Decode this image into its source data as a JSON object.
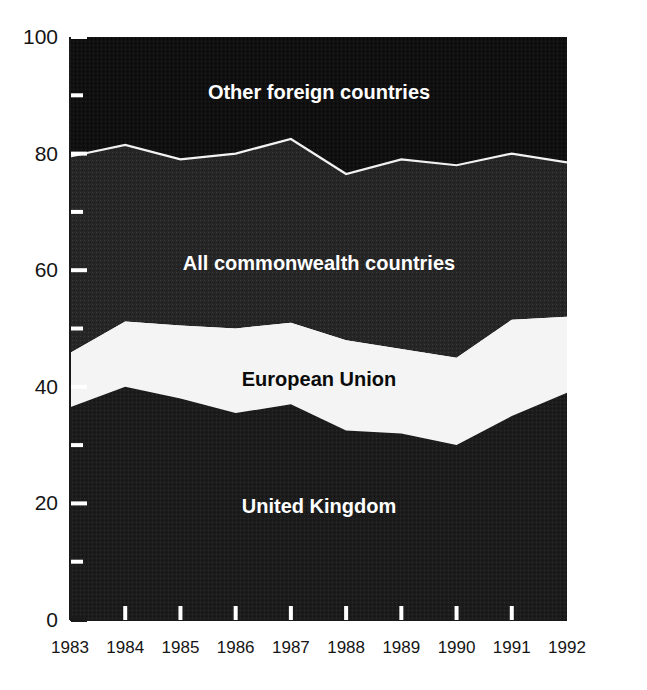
{
  "chart_data": {
    "type": "area",
    "stacked": true,
    "title": "",
    "subtitle": "",
    "xlabel": "",
    "ylabel": "",
    "categories": [
      "1983",
      "1984",
      "1985",
      "1986",
      "1987",
      "1988",
      "1989",
      "1990",
      "1991",
      "1992"
    ],
    "x": [
      1983,
      1984,
      1985,
      1986,
      1987,
      1988,
      1989,
      1990,
      1991,
      1992
    ],
    "xlim": [
      1983,
      1992
    ],
    "ylim": [
      0,
      100
    ],
    "y_ticks": [
      0,
      20,
      40,
      60,
      80,
      100
    ],
    "y_tick_labels": [
      "0",
      "20",
      "40",
      "60",
      "80",
      "100"
    ],
    "y_minor_ticks": [
      10,
      30,
      50,
      70,
      90
    ],
    "grid": false,
    "legend": "inline-band-labels",
    "series": [
      {
        "name": "United Kingdom",
        "color": "#1c1c1c",
        "values": [
          36.5,
          40.0,
          38.0,
          35.5,
          37.0,
          32.5,
          32.0,
          30.0,
          35.0,
          39.0
        ],
        "cumulative_top": [
          36.5,
          40.0,
          38.0,
          35.5,
          37.0,
          32.5,
          32.0,
          30.0,
          35.0,
          39.0
        ]
      },
      {
        "name": "European Union",
        "color": "#f4f4f4",
        "values": [
          9.3,
          11.2,
          12.5,
          14.5,
          14.0,
          15.5,
          14.5,
          15.0,
          16.5,
          13.0
        ],
        "cumulative_top": [
          45.8,
          51.2,
          50.5,
          50.0,
          51.0,
          48.0,
          46.5,
          45.0,
          51.5,
          52.0
        ]
      },
      {
        "name": "All commonwealth countries",
        "color": "#262626",
        "values": [
          33.7,
          30.3,
          28.5,
          30.0,
          31.5,
          28.5,
          32.5,
          33.0,
          28.5,
          26.5
        ],
        "cumulative_top": [
          79.5,
          81.5,
          79.0,
          80.0,
          82.5,
          76.5,
          79.0,
          78.0,
          80.0,
          78.5
        ]
      },
      {
        "name": "Other foreign countries",
        "color": "#101010",
        "values": [
          20.5,
          18.5,
          21.0,
          20.0,
          17.5,
          23.5,
          21.0,
          22.0,
          20.0,
          21.5
        ],
        "cumulative_top": [
          100,
          100,
          100,
          100,
          100,
          100,
          100,
          100,
          100,
          100
        ]
      }
    ],
    "band_labels": [
      {
        "text": "Other foreign countries",
        "tone": "light"
      },
      {
        "text": "All commonwealth countries",
        "tone": "light"
      },
      {
        "text": "European Union",
        "tone": "dark"
      },
      {
        "text": "United Kingdom",
        "tone": "light"
      }
    ]
  },
  "colors": {
    "background": "#ffffff",
    "axis": "#1a1a1a",
    "uk_band": "#1c1c1c",
    "eu_band": "#f4f4f4",
    "commonwealth_band": "#262626",
    "other_band": "#101010",
    "boundary_line": "#f2f2f2",
    "label_light": "#ffffff",
    "label_dark": "#0b0b0b"
  }
}
